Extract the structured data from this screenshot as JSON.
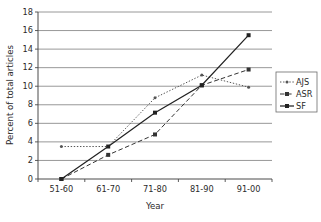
{
  "chart_data": {
    "type": "line",
    "title": "",
    "xlabel": "Year",
    "ylabel": "Percent of total articles",
    "categories": [
      "51-60",
      "61-70",
      "71-80",
      "81-90",
      "91-00"
    ],
    "ylim": [
      0,
      18
    ],
    "ytick_step": 2,
    "yticks": [
      "0",
      "2",
      "4",
      "6",
      "8",
      "10",
      "12",
      "14",
      "16",
      "18"
    ],
    "grid": "horizontal",
    "legend_position": "right",
    "series": [
      {
        "name": "AJS",
        "style": "dotted",
        "marker": "dot",
        "color": "#555555",
        "values": [
          3.5,
          3.5,
          8.75,
          11.2,
          9.9
        ]
      },
      {
        "name": "ASR",
        "style": "dashed",
        "marker": "square",
        "color": "#333333",
        "values": [
          0,
          2.6,
          4.8,
          10.1,
          11.8
        ]
      },
      {
        "name": "SF",
        "style": "solid",
        "marker": "square",
        "color": "#222222",
        "values": [
          0,
          3.5,
          7.15,
          10.1,
          15.5
        ]
      }
    ]
  },
  "axes": {
    "y_tick_0": "0",
    "y_tick_1": "2",
    "y_tick_2": "4",
    "y_tick_3": "6",
    "y_tick_4": "8",
    "y_tick_5": "10",
    "y_tick_6": "12",
    "y_tick_7": "14",
    "y_tick_8": "16",
    "y_tick_9": "18",
    "x_tick_0": "51-60",
    "x_tick_1": "61-70",
    "x_tick_2": "71-80",
    "x_tick_3": "81-90",
    "x_tick_4": "91-00",
    "x_title": "Year",
    "y_title": "Percent of total articles"
  },
  "legend": {
    "item_0": "AJS",
    "item_1": "ASR",
    "item_2": "SF"
  },
  "colors": {
    "gridline": "#8c8c8c",
    "axis": "#4a4a4a",
    "series_ajs": "#555555",
    "series_asr": "#333333",
    "series_sf": "#222222",
    "background": "#ffffff"
  }
}
